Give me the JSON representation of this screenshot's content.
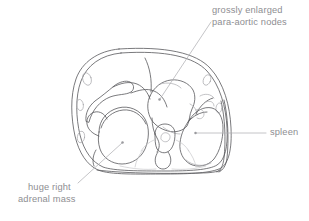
{
  "figure": {
    "kind": "medical-line-drawing",
    "view": "axial-ct-cross-section-abdomen",
    "background_color": "#ffffff",
    "stroke_color": "#58585c",
    "label_color": "#8e8e92",
    "leader_color": "#b0b0b4"
  },
  "labels": {
    "para_aortic": {
      "line1": "grossly enlarged",
      "line2": "para-aortic nodes"
    },
    "spleen": {
      "line1": "spleen"
    },
    "adrenal": {
      "line1": "huge right",
      "line2": "adrenal mass"
    }
  }
}
